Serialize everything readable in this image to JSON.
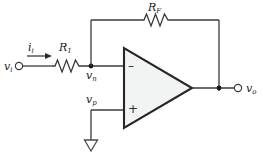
{
  "figure": {
    "kind": "circuit-schematic",
    "name": "inverting-operational-amplifier",
    "background_color": "#ffffff",
    "wire_color": "#3a3a3a",
    "label_color": "#1a1a1a",
    "opamp_fill_color": "#f2f4f4",
    "opamp_border_color": "#262626"
  },
  "labels": {
    "source_voltage": "v",
    "source_voltage_sub": "i",
    "input_current": "i",
    "input_current_sub": "i",
    "input_resistor": "R",
    "input_resistor_sub": "1",
    "feedback_resistor": "R",
    "feedback_resistor_sub": "F",
    "inverting_node": "v",
    "inverting_node_sub": "n",
    "noninverting_node": "v",
    "noninverting_node_sub": "p",
    "output_voltage": "v",
    "output_voltage_sub": "o",
    "inverting_terminal_sign": "–",
    "noninverting_terminal_sign": "+"
  },
  "components": [
    {
      "name": "input-source-terminal",
      "type": "terminal",
      "label": "v_i"
    },
    {
      "name": "input-current-arrow",
      "type": "current-arrow",
      "label": "i_i",
      "direction": "right"
    },
    {
      "name": "input-resistor",
      "type": "resistor",
      "label": "R_1"
    },
    {
      "name": "feedback-resistor",
      "type": "resistor",
      "label": "R_F"
    },
    {
      "name": "operational-amplifier",
      "type": "opamp",
      "inverting_input": "v_n",
      "noninverting_input": "v_p",
      "output": "v_o"
    },
    {
      "name": "ground-symbol",
      "type": "ground"
    },
    {
      "name": "output-terminal",
      "type": "terminal",
      "label": "v_o"
    },
    {
      "name": "inverting-node-dot",
      "type": "junction"
    },
    {
      "name": "output-node-dot",
      "type": "junction"
    }
  ]
}
